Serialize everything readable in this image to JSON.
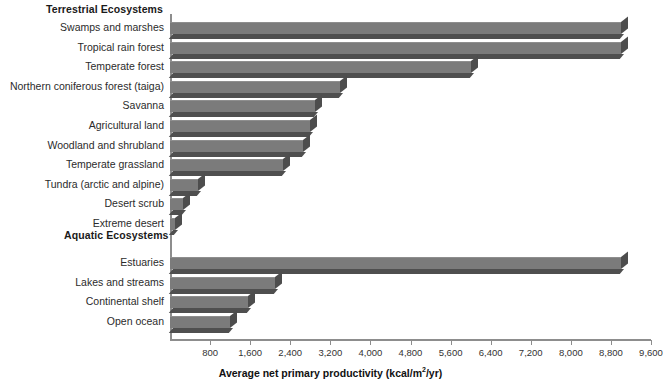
{
  "chart_data": {
    "type": "bar",
    "title": "",
    "xlabel": "Average net primary productivity (kcal/m2/yr)",
    "xlabel_prefix": "Average net primary productivity (kcal/m",
    "xlabel_sup": "2",
    "xlabel_suffix": "/yr)",
    "ylabel": "",
    "orientation": "horizontal",
    "xlim": [
      0,
      9600
    ],
    "xticks": [
      800,
      1600,
      2400,
      3200,
      4000,
      4800,
      5600,
      6400,
      7200,
      8000,
      8800,
      9600
    ],
    "xtick_labels": [
      "800",
      "1,600",
      "2,400",
      "3,200",
      "4,000",
      "4,800",
      "5,600",
      "6,400",
      "7,200",
      "8,000",
      "8,800",
      "9,600"
    ],
    "grid": false,
    "legend": null,
    "bar_color": "#7b7b7b",
    "bar_side_color": "#4d4d4d",
    "bar_shadow_color": "#4f4f4f",
    "axis_color": "#8d8d8d",
    "groups": [
      {
        "name": "Terrestrial Ecosystems",
        "categories": [
          "Swamps and marshes",
          "Tropical rain forest",
          "Temperate forest",
          "Northern coniferous forest (taiga)",
          "Savanna",
          "Agricultural land",
          "Woodland and shrubland",
          "Temperate grassland",
          "Tundra (arctic and alpine)",
          "Desert scrub",
          "Extreme desert"
        ],
        "values": [
          9000,
          9000,
          6000,
          3400,
          2900,
          2800,
          2650,
          2250,
          550,
          250,
          90
        ]
      },
      {
        "name": "Aquatic Ecosystems",
        "categories": [
          "Estuaries",
          "Lakes and streams",
          "Continental shelf",
          "Open ocean"
        ],
        "values": [
          9000,
          2100,
          1550,
          1200
        ]
      }
    ]
  },
  "headings": {
    "terrestrial": "Terrestrial Ecosystems",
    "aquatic": "Aquatic Ecosystems"
  }
}
